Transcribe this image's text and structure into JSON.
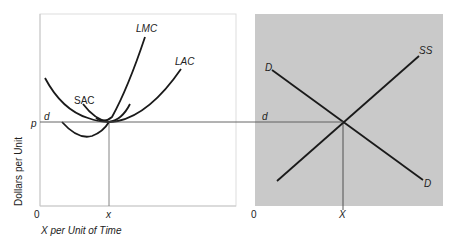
{
  "figure": {
    "left_panel": {
      "name": "firm-cost-curves",
      "y_axis_label": "Dollars per Unit",
      "x_axis_label": "X per Unit of Time",
      "origin_label": "0",
      "price_label": "p",
      "demand_label": "d",
      "quantity_label": "x",
      "curves": {
        "lmc": "LMC",
        "lac": "LAC",
        "sac": "SAC"
      }
    },
    "right_panel": {
      "name": "industry-market",
      "origin_label": "0",
      "quantity_label": "X",
      "demand_label": "d",
      "supply_label": "SS",
      "demand_curve_top_label": "D",
      "demand_curve_bottom_label": "D",
      "background_color": "#c9c9c9"
    },
    "colors": {
      "curve": "#1a1a1a",
      "axis": "#c8c8c8",
      "guide_line": "#555555",
      "panel_shade": "#c9c9c9"
    }
  }
}
